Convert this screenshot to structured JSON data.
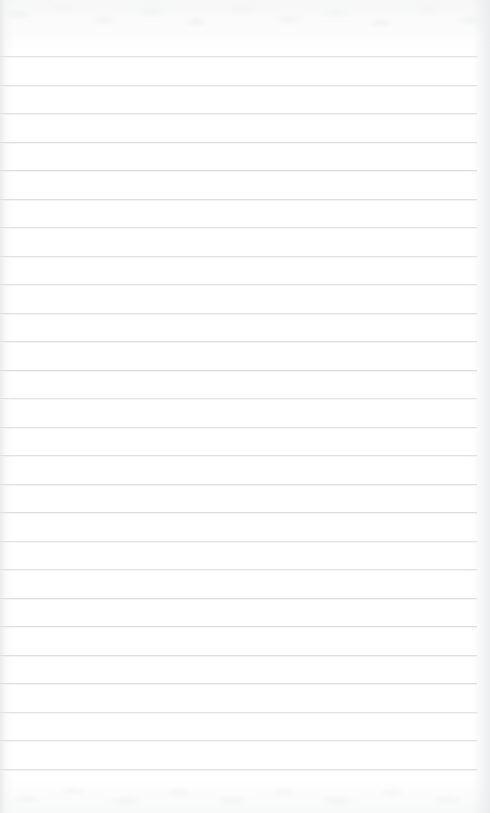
{
  "document": {
    "kind": "ruled-notebook-paper",
    "title": "Blank Lined Paper",
    "orientation": "portrait",
    "width_px": 490,
    "height_px": 813,
    "content_text": "",
    "is_blank": true
  },
  "paper": {
    "background_color": "#fdfdfd",
    "base_tint_color": "#fefefe",
    "edge_shadow_color": "#e2e3e5",
    "texture": "mottled-scan-grain",
    "texture_bands": [
      "top",
      "bottom"
    ]
  },
  "rules": {
    "line_color": "#dcdee0",
    "line_thickness_px": 1,
    "line_spacing_px": 28.5,
    "first_line_y_px": 56,
    "last_line_y_px": 783,
    "line_start_x_px": 0,
    "line_end_x_px": 477,
    "count": 26,
    "left_margin_rule": false,
    "positions_y": [
      56,
      84.5,
      113,
      141.5,
      170,
      198.5,
      227,
      255.5,
      284,
      312.5,
      341,
      369.5,
      398,
      426.5,
      455,
      483.5,
      512,
      540.5,
      569,
      597.5,
      626,
      654.5,
      683,
      711.5,
      740,
      768.5
    ]
  }
}
